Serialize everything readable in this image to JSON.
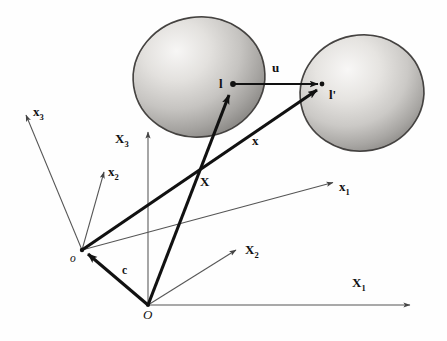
{
  "figure": {
    "background_color": "#fefefe",
    "ink_color": "#111111",
    "thin_axis_color": "#555555",
    "width": 447,
    "height": 341
  },
  "bodies": [
    {
      "name": "reference-body",
      "label": "undeformed-blob",
      "cx": 199,
      "cy": 77,
      "rx": 66,
      "ry": 60,
      "rotation": -8,
      "fill_light": "#f2f1ef",
      "fill_mid": "#c9c7c4",
      "fill_dark": "#8f8d8a",
      "outline": "#4a4a4a"
    },
    {
      "name": "current-body",
      "label": "deformed-blob",
      "cx": 362,
      "cy": 93,
      "rx": 62,
      "ry": 58,
      "rotation": -10,
      "fill_light": "#f4f3f1",
      "fill_mid": "#cdcbc8",
      "fill_dark": "#949290",
      "outline": "#4a4a4a"
    }
  ],
  "points": [
    {
      "name": "material-point-l",
      "label": "l",
      "x": 233,
      "y": 84
    },
    {
      "name": "spatial-point-l-prime",
      "label": "l'",
      "x": 322,
      "y": 84
    },
    {
      "name": "current-origin-o",
      "label": "o",
      "x": 82,
      "y": 250
    },
    {
      "name": "reference-origin-O",
      "label": "O",
      "x": 148,
      "y": 305
    }
  ],
  "vectors": [
    {
      "name": "displacement-vector-u",
      "label": "u",
      "from": "l",
      "to": "l'",
      "label_x": 272,
      "label_y": 67,
      "weight": "thin-bold"
    },
    {
      "name": "position-vector-x",
      "label": "x",
      "from": "o",
      "to": "l'",
      "label_x": 252,
      "label_y": 141,
      "weight": "thick"
    },
    {
      "name": "material-position-vector-X",
      "label": "X",
      "from": "O",
      "to": "l",
      "label_x": 200,
      "label_y": 182,
      "weight": "thick"
    },
    {
      "name": "offset-vector-c",
      "label": "c",
      "from": "O",
      "to": "o",
      "label_x": 122,
      "label_y": 272,
      "weight": "thick"
    }
  ],
  "axes": {
    "current_frame": {
      "name": "lowercase-spatial-axes",
      "origin": "o",
      "items": [
        {
          "name": "axis-x1",
          "base": "x",
          "sub": "1",
          "tip_x": 335,
          "tip_y": 182,
          "label_x": 339,
          "label_y": 186
        },
        {
          "name": "axis-x2",
          "base": "x",
          "sub": "2",
          "tip_x": 105,
          "tip_y": 170,
          "label_x": 108,
          "label_y": 172
        },
        {
          "name": "axis-x3",
          "base": "x",
          "sub": "3",
          "tip_x": 25,
          "tip_y": 113,
          "label_x": 33,
          "label_y": 112
        }
      ]
    },
    "reference_frame": {
      "name": "uppercase-material-axes",
      "origin": "O",
      "items": [
        {
          "name": "axis-X1",
          "base": "X",
          "sub": "1",
          "tip_x": 412,
          "tip_y": 305,
          "label_x": 355,
          "label_y": 283
        },
        {
          "name": "axis-X2",
          "base": "X",
          "sub": "2",
          "tip_x": 238,
          "tip_y": 248,
          "label_x": 245,
          "label_y": 250
        },
        {
          "name": "axis-X3",
          "base": "X",
          "sub": "3",
          "tip_x": 148,
          "tip_y": 130,
          "label_x": 117,
          "label_y": 139
        }
      ]
    }
  }
}
